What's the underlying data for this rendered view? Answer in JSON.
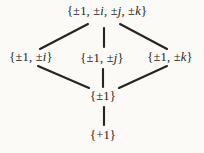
{
  "figure": {
    "background_color": "#fbfaf7",
    "ink_color": "#262320",
    "nodes": [
      {
        "id": "group",
        "label": "{±1, ±i, ±j, ±k}",
        "x": 107,
        "y": 11
      },
      {
        "id": "sub-i",
        "label": "{±1, ±i}",
        "x": 31,
        "y": 57
      },
      {
        "id": "sub-j",
        "label": "{±1, ±j}",
        "x": 102,
        "y": 58
      },
      {
        "id": "sub-k",
        "label": "{±1, ±k}",
        "x": 170,
        "y": 57
      },
      {
        "id": "center",
        "label": "{±1}",
        "x": 103,
        "y": 96
      },
      {
        "id": "trivial",
        "label": "{+1}",
        "x": 103,
        "y": 135
      }
    ],
    "edges": [
      {
        "from": "group",
        "to": "sub-i",
        "x1": 88,
        "y1": 24,
        "x2": 40,
        "y2": 49
      },
      {
        "from": "group",
        "to": "sub-j",
        "x1": 104,
        "y1": 28,
        "x2": 104,
        "y2": 47
      },
      {
        "from": "group",
        "to": "sub-k",
        "x1": 120,
        "y1": 24,
        "x2": 167,
        "y2": 49
      },
      {
        "from": "sub-i",
        "to": "center",
        "x1": 38,
        "y1": 66,
        "x2": 89,
        "y2": 88
      },
      {
        "from": "sub-j",
        "to": "center",
        "x1": 103,
        "y1": 69,
        "x2": 103,
        "y2": 87
      },
      {
        "from": "sub-k",
        "to": "center",
        "x1": 167,
        "y1": 66,
        "x2": 119,
        "y2": 88
      },
      {
        "from": "center",
        "to": "trivial",
        "x1": 104,
        "y1": 107,
        "x2": 104,
        "y2": 125
      }
    ]
  }
}
